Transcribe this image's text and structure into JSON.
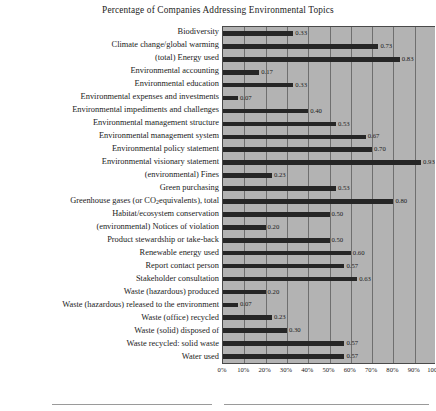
{
  "chart_data": {
    "type": "bar",
    "orientation": "horizontal",
    "title": "Percentage of Companies Addressing Environmental Topics",
    "xlabel": "",
    "ylabel": "",
    "xlim": [
      0,
      1
    ],
    "grid": true,
    "legend": "none",
    "xtick_labels": [
      "0%",
      "10%",
      "20%",
      "30%",
      "40%",
      "50%",
      "60%",
      "70%",
      "80%",
      "90%",
      "100%"
    ],
    "xtick_values": [
      0,
      0.1,
      0.2,
      0.3,
      0.4,
      0.5,
      0.6,
      0.7,
      0.8,
      0.9,
      1.0
    ],
    "categories": [
      "Biodiversity",
      "Climate change/global warming",
      "(total) Energy used",
      "Environmental accounting",
      "Environmental education",
      "Environmental expenses and investments",
      "Environmental impediments and challenges",
      "Environmental management structure",
      "Environmental management system",
      "Environmental policy statement",
      "Environmental visionary statement",
      "(environmental) Fines",
      "Green purchasing",
      "Greenhouse gases (or CO2 equivalents), total",
      "Habitat/ecosystem conservation",
      "(environmental) Notices of violation",
      "Product stewardship or take-back",
      "Renewable energy used",
      "Report contact person",
      "Stakeholder consultation",
      "Waste (hazardous) produced",
      "Waste (hazardous) released to the environment",
      "Waste (office) recycled",
      "Waste (solid) disposed of",
      "Waste recycled: solid waste",
      "Water used"
    ],
    "values": [
      0.33,
      0.73,
      0.83,
      0.17,
      0.33,
      0.07,
      0.4,
      0.53,
      0.67,
      0.7,
      0.93,
      0.23,
      0.53,
      0.8,
      0.5,
      0.2,
      0.5,
      0.6,
      0.57,
      0.63,
      0.2,
      0.07,
      0.23,
      0.3,
      0.57,
      0.57
    ],
    "value_labels": [
      "0.33",
      "0.73",
      "0.83",
      "0.17",
      "0.33",
      "0.07",
      "0.40",
      "0.53",
      "0.67",
      "0.70",
      "0.93",
      "0.23",
      "0.53",
      "0.80",
      "0.50",
      "0.20",
      "0.50",
      "0.60",
      "0.57",
      "0.63",
      "0.20",
      "0.07",
      "0.23",
      "0.30",
      "0.57",
      "0.57"
    ],
    "colors": {
      "bar": "#262626",
      "plot_background": "#b3b3b3",
      "gridline": "#6f6f6f",
      "text": "#1b1b1b",
      "page_background": "#ffffff"
    }
  }
}
